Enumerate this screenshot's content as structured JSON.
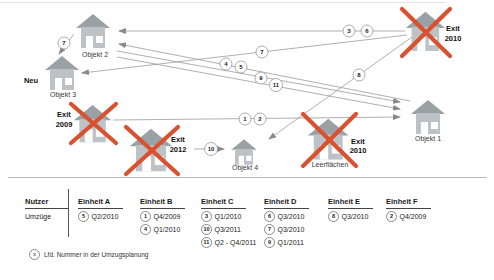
{
  "colors": {
    "exit_cross_red": "#d9512e",
    "building_roof_gray": "#9aa1a4",
    "building_body_gray": "#bcc2c5",
    "arrow_gray": "#9b9b9b"
  },
  "diagram": {
    "buildings": {
      "objekt1": {
        "label": "Objekt 1"
      },
      "objekt2": {
        "label": "Objekt 2"
      },
      "objekt3": {
        "label": "Objekt 3",
        "status": "Neu"
      },
      "objekt4": {
        "label": "Objekt 4"
      },
      "exit2009": {
        "status_line1": "Exit",
        "status_line2": "2009"
      },
      "exit2012": {
        "status_line1": "Exit",
        "status_line2": "2012"
      },
      "exit2010_top": {
        "status_line1": "Exit",
        "status_line2": "2010"
      },
      "leerflaechen": {
        "status_line1": "Exit",
        "status_line2": "2010",
        "label": "Leerflächen"
      }
    },
    "move_markers": {
      "m1": "1",
      "m2": "2",
      "m3": "3",
      "m4": "4",
      "m5": "5",
      "m6": "6",
      "m7a": "7",
      "m7b": "7",
      "m8": "8",
      "m9": "9",
      "m10": "10",
      "m11": "11"
    }
  },
  "table": {
    "row_header": "Nutzer",
    "row_label": "Umzüge",
    "columns": [
      {
        "header": "Einheit A",
        "entries": [
          {
            "num": "5",
            "text": "Q2/2010"
          }
        ]
      },
      {
        "header": "Einheit B",
        "entries": [
          {
            "num": "1",
            "text": "Q4/2009"
          },
          {
            "num": "4",
            "text": "Q1/2010"
          }
        ]
      },
      {
        "header": "Einheit C",
        "entries": [
          {
            "num": "3",
            "text": "Q1/2010"
          },
          {
            "num": "10",
            "text": "Q3/2011"
          },
          {
            "num": "11",
            "text": "Q2 - Q4/2011"
          }
        ]
      },
      {
        "header": "Einheit D",
        "entries": [
          {
            "num": "6",
            "text": "Q3/2010"
          },
          {
            "num": "7",
            "text": "Q3/2010"
          },
          {
            "num": "9",
            "text": "Q1/2011"
          }
        ]
      },
      {
        "header": "Einheit E",
        "entries": [
          {
            "num": "8",
            "text": "Q3/2010"
          }
        ]
      },
      {
        "header": "Einheit F",
        "entries": [
          {
            "num": "2",
            "text": "Q4/2009"
          }
        ]
      }
    ]
  },
  "legend": {
    "symbol": "x",
    "text": "Lfd. Nummer in der Umzugsplanung"
  }
}
